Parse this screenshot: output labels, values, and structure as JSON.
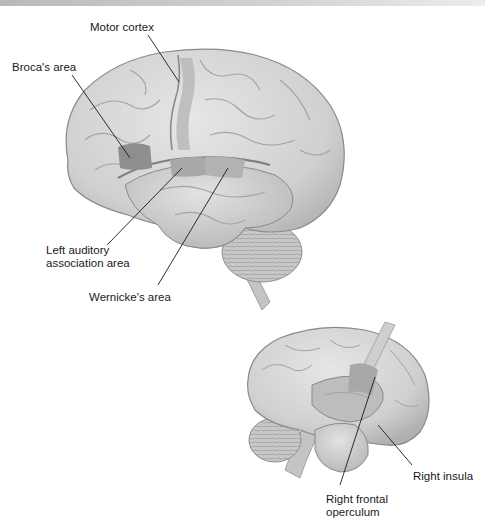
{
  "figure": {
    "left_hemisphere": {
      "view": "lateral view, left hemisphere",
      "labels": {
        "motor_cortex": "Motor cortex",
        "brocas_area": "Broca's area",
        "left_auditory_line1": "Left auditory",
        "left_auditory_line2": "association area",
        "wernickes_area": "Wernicke's area"
      }
    },
    "right_hemisphere": {
      "view": "lateral view, right hemisphere with operculum retracted",
      "labels": {
        "right_insula": "Right insula",
        "right_frontal_operculum_line1": "Right frontal",
        "right_frontal_operculum_line2": "operculum"
      }
    },
    "colors": {
      "brain_fill": "#d6d6d6",
      "brain_shade": "#b3b3b3",
      "sulcus": "#9a9a9a",
      "highlight_region": "#8e8e8e",
      "highlight_light": "#a8a8a8",
      "leader_line": "#1a1a1a",
      "text": "#1a1a1a"
    }
  }
}
